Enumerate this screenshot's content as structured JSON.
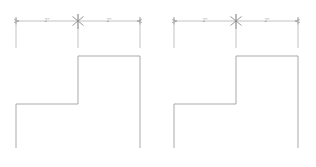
{
  "drawing": {
    "title": "Step profile dimensioned drawings",
    "line_color": "#b4b4b4",
    "outline_color": "#a9a9a9",
    "text_color": "#9a9a9a",
    "background_color": "#ffffff"
  },
  "figures": [
    {
      "id": "figure-left",
      "name": "left-step-figure",
      "dimensions": [
        {
          "label": "2\"",
          "position": "left-segment"
        },
        {
          "label": "2\"",
          "position": "right-segment"
        }
      ],
      "tick_marks": [
        "left-end-tick",
        "center-cross-tick",
        "right-end-tick"
      ]
    },
    {
      "id": "figure-right",
      "name": "right-step-figure",
      "dimensions": [
        {
          "label": "2\"",
          "position": "left-segment"
        },
        {
          "label": "2\"",
          "position": "right-segment"
        }
      ],
      "tick_marks": [
        "left-end-tick",
        "center-cross-tick",
        "right-end-tick"
      ]
    }
  ]
}
